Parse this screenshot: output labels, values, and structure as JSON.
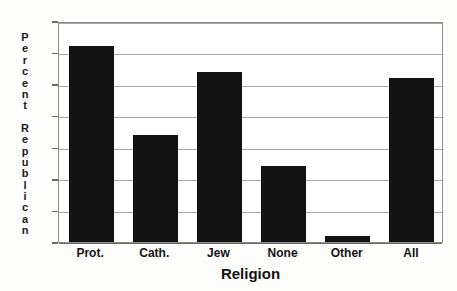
{
  "chart_data": {
    "type": "bar",
    "title": "",
    "xlabel": "Religion",
    "ylabel": "Percent Republican",
    "categories": [
      "Prot.",
      "Cath.",
      "Jew",
      "None",
      "Other",
      "All"
    ],
    "values": [
      31,
      17,
      27,
      12,
      1,
      26
    ],
    "ylim": [
      0,
      35
    ],
    "ytick_step": 5,
    "yticks": [
      0,
      5,
      10,
      15,
      20,
      25,
      30,
      35
    ],
    "ytick_labels": [
      "0",
      "5",
      "10",
      "15",
      "20",
      "25",
      "30",
      "35"
    ],
    "grid": true,
    "grid_axis": "y",
    "legend": false,
    "legend_position": "none",
    "bar_color": "#121212",
    "grid_color": "#a8a8a8",
    "axis_color": "#6b6b6b",
    "background_color": "#ffffff",
    "series": [
      {
        "name": "Percent Republican",
        "values": [
          31,
          17,
          27,
          12,
          1,
          26
        ]
      }
    ]
  },
  "ylabel_chars": {
    "word1": [
      "P",
      "e",
      "r",
      "c",
      "e",
      "n",
      "t"
    ],
    "word2": [
      "R",
      "e",
      "p",
      "u",
      "b",
      "l",
      "i",
      "c",
      "a",
      "n"
    ]
  }
}
